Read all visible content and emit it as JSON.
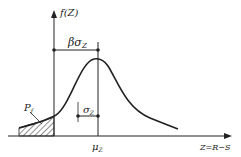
{
  "diagram": {
    "type": "probability-density",
    "y_axis_label": "f(Z)",
    "x_axis_label": "Z=R−S",
    "mean_label": "μ",
    "mean_sub": "Z",
    "beta_label": "βσ",
    "beta_sub": "Z",
    "sigma_label": "σ",
    "sigma_sub": "Z",
    "failure_label": "P",
    "failure_sub": "f",
    "colors": {
      "stroke": "#222222",
      "background": "#ffffff"
    }
  }
}
